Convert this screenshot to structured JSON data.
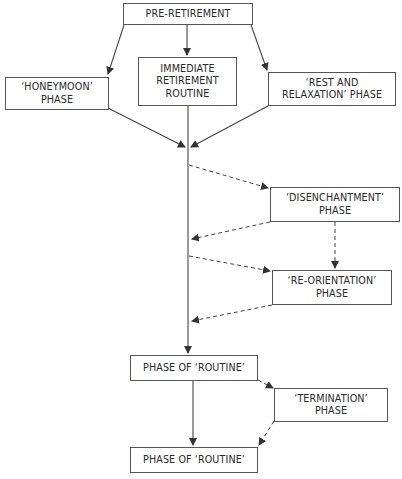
{
  "diagram": {
    "nodes": {
      "pre_retirement": {
        "line1": "PRE-RETIREMENT"
      },
      "honeymoon": {
        "line1": "‘HONEYMOON’",
        "line2": "PHASE"
      },
      "immediate_routine": {
        "line1": "IMMEDIATE",
        "line2": "RETIREMENT",
        "line3": "ROUTINE"
      },
      "rest_relaxation": {
        "line1": "‘REST AND",
        "line2": "RELAXATION’ PHASE"
      },
      "disenchantment": {
        "line1": "‘DISENCHANTMENT’",
        "line2": "PHASE"
      },
      "reorientation": {
        "line1": "‘RE-ORIENTATION’",
        "line2": "PHASE"
      },
      "routine_1": {
        "line1": "PHASE OF ‘ROUTINE’"
      },
      "termination": {
        "line1": "‘TERMINATION’",
        "line2": "PHASE"
      },
      "routine_2": {
        "line1": "PHASE OF ‘ROUTINE’"
      }
    },
    "edges": [
      {
        "from": "pre_retirement",
        "to": "honeymoon",
        "style": "solid"
      },
      {
        "from": "pre_retirement",
        "to": "immediate_routine",
        "style": "solid"
      },
      {
        "from": "pre_retirement",
        "to": "rest_relaxation",
        "style": "solid"
      },
      {
        "from": "honeymoon",
        "to": "main_line",
        "style": "solid"
      },
      {
        "from": "immediate_routine",
        "to": "main_line",
        "style": "solid"
      },
      {
        "from": "rest_relaxation",
        "to": "main_line",
        "style": "solid"
      },
      {
        "from": "main_line",
        "to": "disenchantment",
        "style": "dashed"
      },
      {
        "from": "disenchantment",
        "to": "main_line",
        "style": "dashed"
      },
      {
        "from": "disenchantment",
        "to": "reorientation",
        "style": "dashed"
      },
      {
        "from": "main_line",
        "to": "reorientation",
        "style": "dashed"
      },
      {
        "from": "reorientation",
        "to": "main_line",
        "style": "dashed"
      },
      {
        "from": "main_line",
        "to": "routine_1",
        "style": "solid"
      },
      {
        "from": "routine_1",
        "to": "termination",
        "style": "dashed"
      },
      {
        "from": "routine_1",
        "to": "routine_2",
        "style": "solid"
      },
      {
        "from": "termination",
        "to": "routine_2",
        "style": "dashed"
      }
    ],
    "colors": {
      "line": "#444444",
      "border": "#555555",
      "text": "#2a2a2a"
    }
  }
}
